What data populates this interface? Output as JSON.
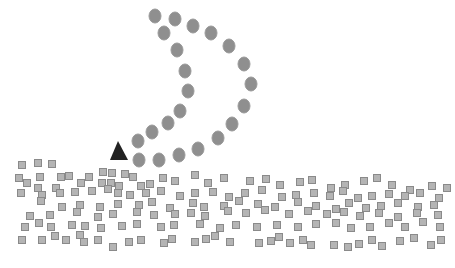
{
  "colors": {
    "circle_fill": "#8f8f8f",
    "circle_stroke": "#9a9a9a",
    "square_fill": "#b4b4b4",
    "square_stroke": "#8a8a8a",
    "triangle_fill": "#222222"
  },
  "triangle": {
    "points": "118,141 110,160 128,160"
  },
  "circles": [
    [
      155,
      16
    ],
    [
      175,
      19
    ],
    [
      193,
      26
    ],
    [
      211,
      33
    ],
    [
      229,
      46
    ],
    [
      244,
      64
    ],
    [
      251,
      84
    ],
    [
      164,
      33
    ],
    [
      177,
      50
    ],
    [
      185,
      71
    ],
    [
      188,
      91
    ],
    [
      180,
      111
    ],
    [
      168,
      123
    ],
    [
      152,
      132
    ],
    [
      138,
      141
    ],
    [
      139,
      160
    ],
    [
      159,
      160
    ],
    [
      179,
      155
    ],
    [
      198,
      149
    ],
    [
      218,
      138
    ],
    [
      232,
      124
    ],
    [
      244,
      106
    ]
  ],
  "squares": [
    [
      22,
      165
    ],
    [
      38,
      163
    ],
    [
      52,
      164
    ],
    [
      19,
      178
    ],
    [
      40,
      177
    ],
    [
      61,
      177
    ],
    [
      69,
      176
    ],
    [
      89,
      177
    ],
    [
      103,
      172
    ],
    [
      112,
      173
    ],
    [
      125,
      174
    ],
    [
      133,
      177
    ],
    [
      27,
      183
    ],
    [
      38,
      188
    ],
    [
      56,
      188
    ],
    [
      81,
      183
    ],
    [
      102,
      183
    ],
    [
      111,
      183
    ],
    [
      119,
      186
    ],
    [
      141,
      186
    ],
    [
      150,
      184
    ],
    [
      163,
      178
    ],
    [
      175,
      181
    ],
    [
      195,
      175
    ],
    [
      208,
      183
    ],
    [
      224,
      178
    ],
    [
      250,
      181
    ],
    [
      266,
      179
    ],
    [
      280,
      185
    ],
    [
      300,
      182
    ],
    [
      312,
      180
    ],
    [
      331,
      188
    ],
    [
      345,
      185
    ],
    [
      364,
      181
    ],
    [
      377,
      178
    ],
    [
      392,
      185
    ],
    [
      410,
      190
    ],
    [
      432,
      186
    ],
    [
      447,
      188
    ],
    [
      21,
      193
    ],
    [
      42,
      195
    ],
    [
      60,
      193
    ],
    [
      75,
      192
    ],
    [
      92,
      191
    ],
    [
      108,
      189
    ],
    [
      118,
      193
    ],
    [
      130,
      195
    ],
    [
      146,
      193
    ],
    [
      161,
      191
    ],
    [
      180,
      196
    ],
    [
      195,
      193
    ],
    [
      213,
      192
    ],
    [
      229,
      197
    ],
    [
      245,
      193
    ],
    [
      262,
      190
    ],
    [
      282,
      197
    ],
    [
      296,
      195
    ],
    [
      314,
      193
    ],
    [
      330,
      196
    ],
    [
      343,
      191
    ],
    [
      358,
      198
    ],
    [
      372,
      196
    ],
    [
      389,
      194
    ],
    [
      405,
      196
    ],
    [
      420,
      193
    ],
    [
      439,
      198
    ],
    [
      41,
      201
    ],
    [
      62,
      207
    ],
    [
      80,
      205
    ],
    [
      100,
      207
    ],
    [
      118,
      204
    ],
    [
      139,
      205
    ],
    [
      152,
      202
    ],
    [
      170,
      208
    ],
    [
      193,
      203
    ],
    [
      204,
      207
    ],
    [
      224,
      206
    ],
    [
      239,
      201
    ],
    [
      258,
      204
    ],
    [
      275,
      207
    ],
    [
      298,
      202
    ],
    [
      316,
      206
    ],
    [
      336,
      209
    ],
    [
      349,
      203
    ],
    [
      366,
      208
    ],
    [
      381,
      206
    ],
    [
      398,
      203
    ],
    [
      418,
      207
    ],
    [
      434,
      205
    ],
    [
      30,
      216
    ],
    [
      50,
      215
    ],
    [
      77,
      212
    ],
    [
      98,
      217
    ],
    [
      113,
      214
    ],
    [
      137,
      212
    ],
    [
      154,
      215
    ],
    [
      175,
      214
    ],
    [
      191,
      213
    ],
    [
      205,
      216
    ],
    [
      228,
      211
    ],
    [
      246,
      213
    ],
    [
      265,
      210
    ],
    [
      289,
      214
    ],
    [
      308,
      211
    ],
    [
      327,
      214
    ],
    [
      344,
      212
    ],
    [
      360,
      216
    ],
    [
      379,
      213
    ],
    [
      398,
      217
    ],
    [
      417,
      213
    ],
    [
      438,
      215
    ],
    [
      25,
      227
    ],
    [
      39,
      223
    ],
    [
      51,
      227
    ],
    [
      72,
      225
    ],
    [
      85,
      226
    ],
    [
      101,
      228
    ],
    [
      122,
      226
    ],
    [
      137,
      224
    ],
    [
      161,
      227
    ],
    [
      174,
      225
    ],
    [
      200,
      224
    ],
    [
      220,
      228
    ],
    [
      236,
      225
    ],
    [
      257,
      227
    ],
    [
      277,
      225
    ],
    [
      298,
      227
    ],
    [
      316,
      224
    ],
    [
      336,
      223
    ],
    [
      351,
      228
    ],
    [
      370,
      227
    ],
    [
      389,
      223
    ],
    [
      405,
      227
    ],
    [
      423,
      222
    ],
    [
      440,
      227
    ],
    [
      22,
      240
    ],
    [
      42,
      240
    ],
    [
      55,
      236
    ],
    [
      66,
      240
    ],
    [
      80,
      235
    ],
    [
      84,
      242
    ],
    [
      98,
      240
    ],
    [
      113,
      247
    ],
    [
      129,
      242
    ],
    [
      141,
      240
    ],
    [
      164,
      243
    ],
    [
      172,
      239
    ],
    [
      195,
      242
    ],
    [
      206,
      239
    ],
    [
      215,
      236
    ],
    [
      230,
      242
    ],
    [
      259,
      243
    ],
    [
      271,
      241
    ],
    [
      279,
      237
    ],
    [
      290,
      243
    ],
    [
      303,
      240
    ],
    [
      311,
      245
    ],
    [
      334,
      245
    ],
    [
      348,
      247
    ],
    [
      359,
      244
    ],
    [
      372,
      240
    ],
    [
      382,
      246
    ],
    [
      400,
      241
    ],
    [
      414,
      238
    ],
    [
      431,
      245
    ],
    [
      441,
      240
    ]
  ],
  "caption": "Fig. 1 (partially visible caption)"
}
